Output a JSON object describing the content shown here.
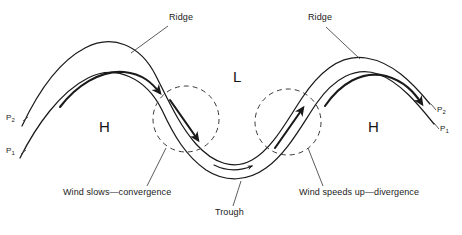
{
  "figure": {
    "type": "meteorological-flow-diagram",
    "background_color": "#ffffff",
    "line_color": "#1a1a1a",
    "dashed_circle_color": "#3a3a3a"
  },
  "labels": {
    "ridge_left": "Ridge",
    "ridge_right": "Ridge",
    "trough": "Trough",
    "low_center": "L",
    "high_left": "H",
    "high_right": "H",
    "convergence": "Wind slows—convergence",
    "divergence": "Wind speeds up—divergence"
  },
  "pressure_contours": {
    "left_upper": {
      "symbol": "P",
      "subscript": "2"
    },
    "left_lower": {
      "symbol": "P",
      "subscript": "1"
    },
    "right_upper": {
      "symbol": "P",
      "subscript": "2"
    },
    "right_lower": {
      "symbol": "P",
      "subscript": "1"
    }
  },
  "annotations": [
    {
      "name": "ridge-left-leader",
      "target": "upper isobar crest, left ridge"
    },
    {
      "name": "ridge-right-leader",
      "target": "upper isobar crest, right ridge"
    },
    {
      "name": "trough-leader",
      "target": "lower isobar base at trough"
    },
    {
      "name": "convergence-leader",
      "target": "left dashed circle"
    },
    {
      "name": "divergence-leader",
      "target": "right dashed circle"
    }
  ],
  "flow_arrows": [
    {
      "name": "ridge-left-flow-arrow",
      "weight": "bold",
      "meaning": "fast geostrophic flow over left ridge"
    },
    {
      "name": "convergence-arrow",
      "weight": "bold",
      "meaning": "flow descending into trough, converging"
    },
    {
      "name": "trough-flow-arrow",
      "weight": "thin",
      "meaning": "slowed flow in trough base"
    },
    {
      "name": "divergence-arrow",
      "weight": "bold",
      "meaning": "flow accelerating out of trough, diverging"
    },
    {
      "name": "ridge-right-flow-arrow",
      "weight": "bold",
      "meaning": "fast geostrophic flow over right ridge"
    }
  ]
}
